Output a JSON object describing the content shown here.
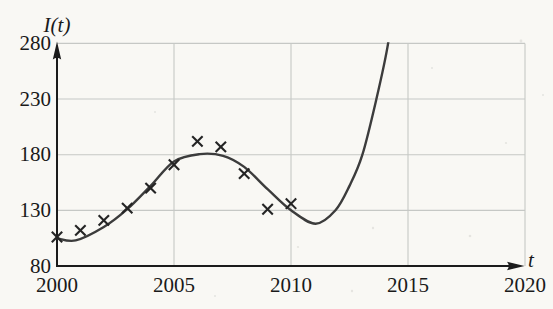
{
  "figure": {
    "colors": {
      "background": "#f9f8f4",
      "grid": "#c6c8c5",
      "axis": "#1b1b1b",
      "curve": "#3c3c3c",
      "marker": "#242424",
      "text": "#1a1a1a"
    }
  },
  "chart_data": {
    "type": "scatter",
    "title": "",
    "xlabel": "t",
    "ylabel": "I(t)",
    "xlim": [
      2000,
      2020
    ],
    "ylim": [
      80,
      280
    ],
    "x_ticks": [
      2000,
      2005,
      2010,
      2015,
      2020
    ],
    "y_ticks": [
      80,
      130,
      180,
      230,
      280
    ],
    "grid": true,
    "legend": "none",
    "marker_style": "x",
    "scatter_points": {
      "x": [
        2000,
        2001,
        2002,
        2003,
        2004,
        2005,
        2006,
        2007,
        2008,
        2009,
        2010
      ],
      "y": [
        106,
        112,
        121,
        132,
        150,
        171,
        192,
        187,
        163,
        131,
        136
      ]
    },
    "fitted_curve": {
      "description": "smooth model curve through the data, rising steeply after 2012 and clipped at I = 280 near t = 2014.2",
      "points": [
        [
          2000.0,
          105
        ],
        [
          2000.8,
          103
        ],
        [
          2002.0,
          115
        ],
        [
          2003.0,
          131
        ],
        [
          2004.0,
          152
        ],
        [
          2005.0,
          174
        ],
        [
          2006.1,
          180.5
        ],
        [
          2007.1,
          179
        ],
        [
          2008.0,
          169
        ],
        [
          2009.0,
          149
        ],
        [
          2010.0,
          130
        ],
        [
          2011.05,
          118
        ],
        [
          2011.9,
          130
        ],
        [
          2012.5,
          152
        ],
        [
          2013.05,
          180
        ],
        [
          2013.65,
          230
        ],
        [
          2014.15,
          280
        ],
        [
          2014.35,
          320
        ]
      ]
    }
  }
}
